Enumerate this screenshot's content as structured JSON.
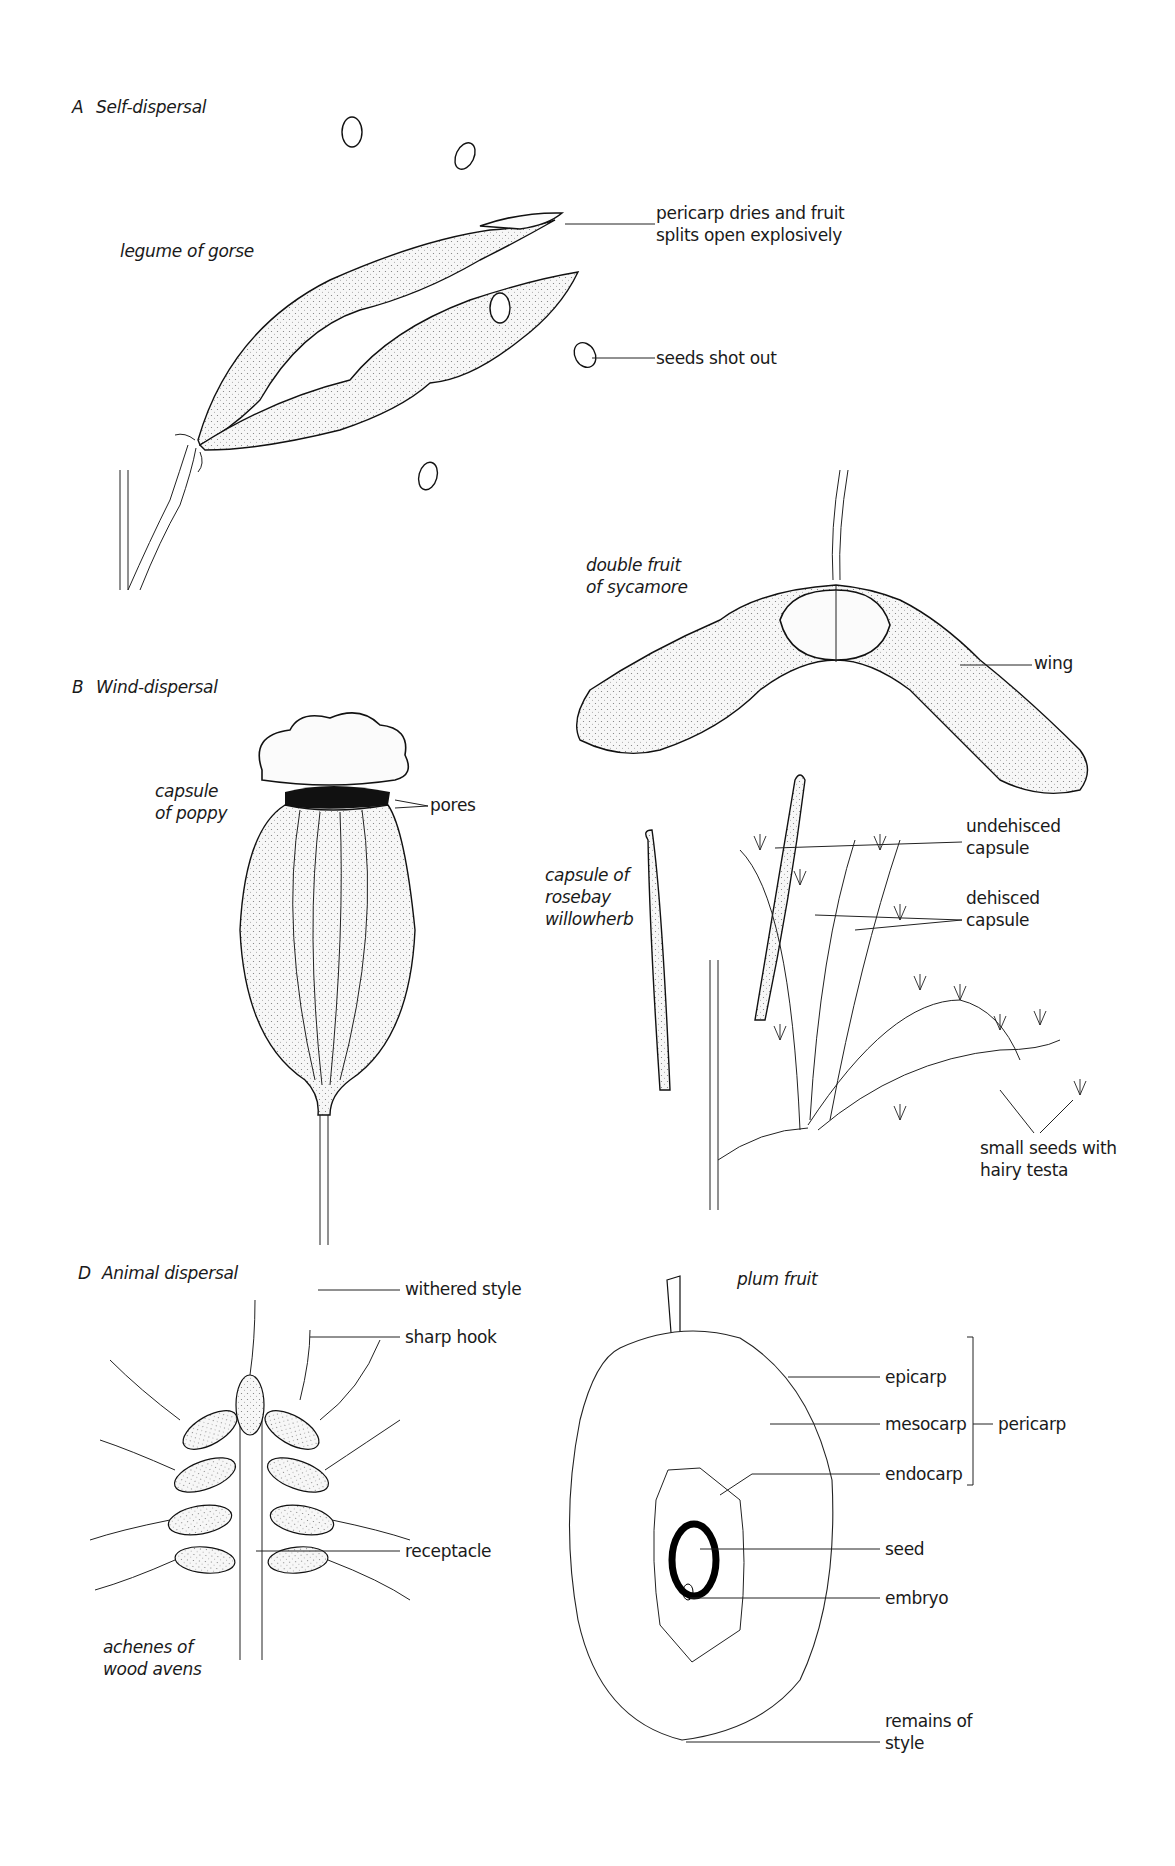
{
  "sections": [
    {
      "letter": "A",
      "title": "Self-dispersal",
      "specimens": [
        {
          "name": "legume of gorse",
          "labels": [
            "pericarp dries and fruit\nsplits open explosively",
            "seeds shot out"
          ]
        }
      ]
    },
    {
      "letter": "B",
      "title": "Wind-dispersal",
      "specimens": [
        {
          "name": "double fruit\nof sycamore",
          "labels": [
            "wing"
          ]
        },
        {
          "name": "capsule\nof poppy",
          "labels": [
            "pores"
          ]
        },
        {
          "name": "capsule of\nrosebay\nwillowherb",
          "labels": [
            "undehisced\ncapsule",
            "dehisced\ncapsule",
            "small seeds with\nhairy testa"
          ]
        }
      ]
    },
    {
      "letter": "D",
      "title": "Animal dispersal",
      "specimens": [
        {
          "name": "achenes of\nwood avens",
          "labels": [
            "withered style",
            "sharp hook",
            "receptacle"
          ]
        },
        {
          "name": "plum fruit",
          "labels": [
            "epicarp",
            "mesocarp",
            "endocarp",
            "seed",
            "embryo",
            "remains of\nstyle"
          ],
          "group_label": "pericarp"
        }
      ]
    }
  ]
}
